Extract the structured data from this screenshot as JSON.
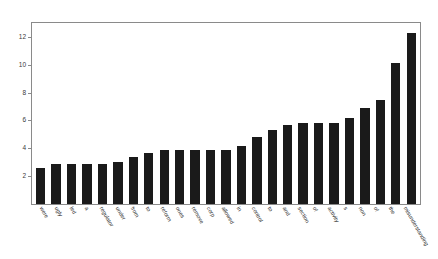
{
  "chart_data": {
    "type": "bar",
    "title": "",
    "subtitle": "",
    "xlabel": "",
    "ylabel": "",
    "ylim": [
      0,
      13
    ],
    "yticks": [
      2,
      4,
      6,
      8,
      10,
      12
    ],
    "grid": false,
    "legend": null,
    "bar_color": "#1a1a1a",
    "background_color": "#ffffff",
    "axis_color": "#8a8a8a",
    "xtick_rotation": 60,
    "categories": [
      "were",
      "ugly",
      "led",
      "a",
      "regulator",
      "under",
      "from",
      "to",
      "reform",
      "ones",
      "remove",
      "corp",
      "allowed",
      "in",
      "control",
      "to",
      "and",
      "section",
      "of",
      "activity",
      "s",
      "non",
      "of",
      "the",
      "misunderstanding"
    ],
    "values": [
      2.6,
      2.9,
      2.9,
      2.9,
      2.9,
      3.0,
      3.4,
      3.7,
      3.9,
      3.9,
      3.9,
      3.9,
      3.9,
      4.2,
      4.8,
      5.3,
      5.7,
      5.8,
      5.8,
      5.8,
      6.2,
      6.9,
      7.5,
      10.1,
      12.3
    ]
  }
}
